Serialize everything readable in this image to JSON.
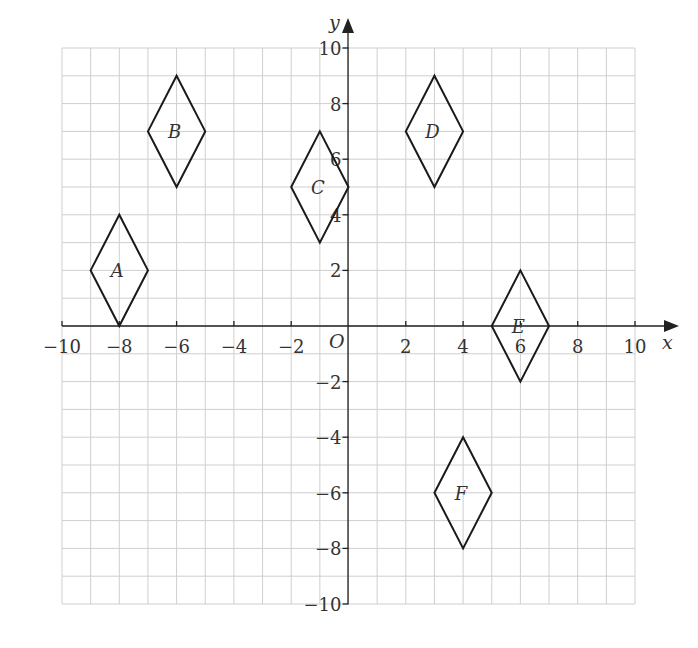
{
  "diagram": {
    "type": "coordinate-grid",
    "x_axis": {
      "label": "x",
      "min": -10,
      "max": 10,
      "tick_step": 2,
      "tick_labels": [
        "−10",
        "−8",
        "−6",
        "−4",
        "−2",
        "2",
        "4",
        "6",
        "8",
        "10"
      ]
    },
    "y_axis": {
      "label": "y",
      "min": -10,
      "max": 10,
      "tick_step": 2,
      "tick_labels": [
        "10",
        "8",
        "6",
        "4",
        "2",
        "−2",
        "−4",
        "−6",
        "−8",
        "−10"
      ]
    },
    "origin_label": "O",
    "grid_step": 1,
    "shapes": [
      {
        "label": "A",
        "vertices": [
          [
            -8,
            4
          ],
          [
            -7,
            2
          ],
          [
            -8,
            0
          ],
          [
            -9,
            2
          ]
        ]
      },
      {
        "label": "B",
        "vertices": [
          [
            -6,
            9
          ],
          [
            -5,
            7
          ],
          [
            -6,
            5
          ],
          [
            -7,
            7
          ]
        ]
      },
      {
        "label": "C",
        "vertices": [
          [
            -1,
            7
          ],
          [
            0,
            5
          ],
          [
            -1,
            3
          ],
          [
            -2,
            5
          ]
        ]
      },
      {
        "label": "D",
        "vertices": [
          [
            3,
            9
          ],
          [
            4,
            7
          ],
          [
            3,
            5
          ],
          [
            2,
            7
          ]
        ]
      },
      {
        "label": "E",
        "vertices": [
          [
            6,
            2
          ],
          [
            7,
            0
          ],
          [
            6,
            -2
          ],
          [
            5,
            0
          ]
        ]
      },
      {
        "label": "F",
        "vertices": [
          [
            4,
            -4
          ],
          [
            5,
            -6
          ],
          [
            4,
            -8
          ],
          [
            3,
            -6
          ]
        ]
      }
    ]
  },
  "colors": {
    "grid": "#cfcfcf",
    "axis": "#222222",
    "shape_stroke": "#1a1a1a",
    "text": "#333333"
  }
}
